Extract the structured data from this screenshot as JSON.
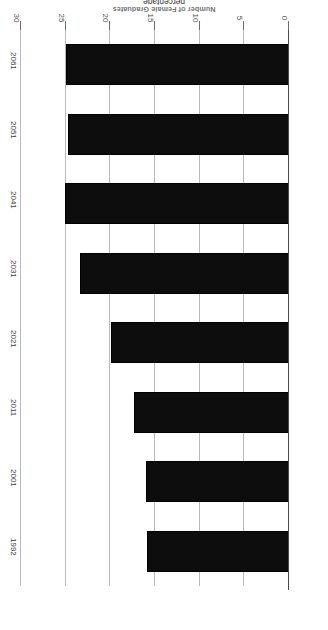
{
  "chart_data": {
    "type": "bar",
    "orientation": "horizontal",
    "rotated_180": true,
    "title": "Number of Female Graduates",
    "categories": [
      "1992",
      "2001",
      "2011",
      "2021",
      "2031",
      "2041",
      "2051",
      "2061"
    ],
    "values": [
      15.9,
      16.0,
      17.3,
      19.9,
      23.4,
      25.1,
      24.7,
      25.0
    ],
    "xlabel": "percentage",
    "ylabel": "",
    "xlim": [
      0,
      30
    ],
    "ticks": [
      "0",
      "5",
      "10",
      "15",
      "20",
      "25",
      "30"
    ],
    "tick_values": [
      0,
      5,
      10,
      15,
      20,
      25,
      30
    ],
    "grid": true,
    "legend": "none",
    "bar_color": "#0d0d0d",
    "gridline_color": "#b9b9b9",
    "axis_color": "#4a4a4a"
  },
  "axis": {
    "value_axis_title": "percentage"
  }
}
